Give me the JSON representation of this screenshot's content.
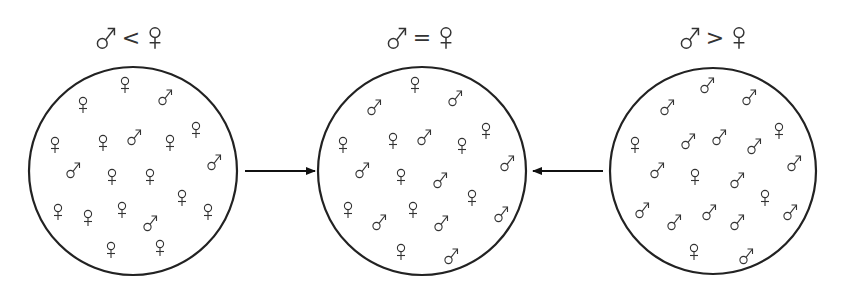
{
  "colors": {
    "stroke": "#222222",
    "glyph": "#333333",
    "background": "#ffffff"
  },
  "glyph_legend": {
    "male": "♂",
    "female": "♀"
  },
  "populations": [
    {
      "id": "male-less",
      "heading": {
        "left": "♂",
        "op": "<",
        "right": "♀",
        "text": "♂ < ♀"
      },
      "circle": {
        "cx": 133,
        "cy": 171,
        "r": 104
      },
      "label_cx": 131,
      "counts": {
        "male": 5,
        "female": 15
      },
      "symbols": [
        {
          "s": "f",
          "x": 125,
          "y": 85
        },
        {
          "s": "m",
          "x": 166,
          "y": 97
        },
        {
          "s": "f",
          "x": 83,
          "y": 105
        },
        {
          "s": "f",
          "x": 55,
          "y": 145
        },
        {
          "s": "f",
          "x": 103,
          "y": 143
        },
        {
          "s": "m",
          "x": 135,
          "y": 137
        },
        {
          "s": "f",
          "x": 170,
          "y": 143
        },
        {
          "s": "f",
          "x": 196,
          "y": 130
        },
        {
          "s": "m",
          "x": 74,
          "y": 170
        },
        {
          "s": "f",
          "x": 112,
          "y": 177
        },
        {
          "s": "f",
          "x": 150,
          "y": 177
        },
        {
          "s": "m",
          "x": 215,
          "y": 162
        },
        {
          "s": "f",
          "x": 182,
          "y": 198
        },
        {
          "s": "f",
          "x": 58,
          "y": 212
        },
        {
          "s": "f",
          "x": 88,
          "y": 218
        },
        {
          "s": "f",
          "x": 122,
          "y": 210
        },
        {
          "s": "m",
          "x": 151,
          "y": 223
        },
        {
          "s": "f",
          "x": 208,
          "y": 212
        },
        {
          "s": "f",
          "x": 111,
          "y": 250
        },
        {
          "s": "f",
          "x": 160,
          "y": 248
        }
      ]
    },
    {
      "id": "equal",
      "heading": {
        "left": "♂",
        "op": "=",
        "right": "♀",
        "text": "♂ = ♀"
      },
      "circle": {
        "cx": 422,
        "cy": 171,
        "r": 104
      },
      "label_cx": 422,
      "counts": {
        "male": 10,
        "female": 10
      },
      "symbols": [
        {
          "s": "f",
          "x": 415,
          "y": 85
        },
        {
          "s": "m",
          "x": 456,
          "y": 98
        },
        {
          "s": "m",
          "x": 375,
          "y": 107
        },
        {
          "s": "f",
          "x": 343,
          "y": 145
        },
        {
          "s": "f",
          "x": 393,
          "y": 141
        },
        {
          "s": "m",
          "x": 425,
          "y": 137
        },
        {
          "s": "f",
          "x": 462,
          "y": 146
        },
        {
          "s": "f",
          "x": 486,
          "y": 131
        },
        {
          "s": "m",
          "x": 363,
          "y": 170
        },
        {
          "s": "f",
          "x": 401,
          "y": 177
        },
        {
          "s": "m",
          "x": 441,
          "y": 180
        },
        {
          "s": "m",
          "x": 508,
          "y": 163
        },
        {
          "s": "f",
          "x": 472,
          "y": 198
        },
        {
          "s": "f",
          "x": 348,
          "y": 210
        },
        {
          "s": "m",
          "x": 380,
          "y": 222
        },
        {
          "s": "f",
          "x": 413,
          "y": 210
        },
        {
          "s": "m",
          "x": 442,
          "y": 223
        },
        {
          "s": "m",
          "x": 502,
          "y": 214
        },
        {
          "s": "f",
          "x": 401,
          "y": 252
        },
        {
          "s": "m",
          "x": 452,
          "y": 256
        }
      ]
    },
    {
      "id": "male-greater",
      "heading": {
        "left": "♂",
        "op": ">",
        "right": "♀",
        "text": "♂ > ♀"
      },
      "circle": {
        "cx": 713,
        "cy": 171,
        "r": 103
      },
      "label_cx": 715,
      "counts": {
        "male": 14,
        "female": 6
      },
      "symbols": [
        {
          "s": "m",
          "x": 708,
          "y": 85
        },
        {
          "s": "m",
          "x": 750,
          "y": 97
        },
        {
          "s": "m",
          "x": 668,
          "y": 107
        },
        {
          "s": "f",
          "x": 635,
          "y": 145
        },
        {
          "s": "m",
          "x": 689,
          "y": 141
        },
        {
          "s": "m",
          "x": 720,
          "y": 137
        },
        {
          "s": "m",
          "x": 755,
          "y": 146
        },
        {
          "s": "f",
          "x": 779,
          "y": 131
        },
        {
          "s": "m",
          "x": 658,
          "y": 170
        },
        {
          "s": "f",
          "x": 695,
          "y": 177
        },
        {
          "s": "m",
          "x": 738,
          "y": 180
        },
        {
          "s": "m",
          "x": 795,
          "y": 163
        },
        {
          "s": "f",
          "x": 765,
          "y": 198
        },
        {
          "s": "m",
          "x": 643,
          "y": 210
        },
        {
          "s": "m",
          "x": 675,
          "y": 222
        },
        {
          "s": "m",
          "x": 710,
          "y": 212
        },
        {
          "s": "m",
          "x": 738,
          "y": 222
        },
        {
          "s": "m",
          "x": 791,
          "y": 212
        },
        {
          "s": "f",
          "x": 694,
          "y": 252
        },
        {
          "s": "m",
          "x": 747,
          "y": 256
        }
      ]
    }
  ],
  "arrows": [
    {
      "id": "arrow-left-to-center",
      "from": [
        245,
        171
      ],
      "to": [
        315,
        171
      ],
      "direction": "right"
    },
    {
      "id": "arrow-right-to-center",
      "from": [
        603,
        171
      ],
      "to": [
        533,
        171
      ],
      "direction": "left"
    }
  ]
}
